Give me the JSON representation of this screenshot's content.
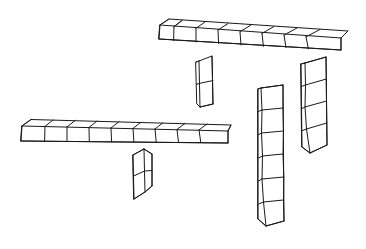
{
  "page": {
    "width": 366,
    "height": 249,
    "background_color": "#ffffff",
    "line_color": "#1a1a1a",
    "face_color": "#ffffff",
    "style": "hand-drawn isometric wireframe line art",
    "stroke_width": 1
  },
  "chart_data": {
    "type": "diagram",
    "subtitle": "",
    "grid": false,
    "legend": false,
    "axis_labels": {
      "x": "",
      "y": ""
    },
    "units_total": 31,
    "shape_count": 6,
    "shapes": [
      {
        "id": "top-horizontal-bar",
        "name": "Top horizontal bar",
        "orientation": "horizontal",
        "cube_count": 8,
        "bounding_box": {
          "x": 157,
          "y": 19,
          "width": 190,
          "height": 34
        },
        "notes": "Longest run; top face and front face both visible, receding to the right"
      },
      {
        "id": "upper-middle-stub",
        "name": "Upper middle vertical stub",
        "orientation": "vertical",
        "cube_count": 2,
        "bounding_box": {
          "x": 195,
          "y": 56,
          "width": 19,
          "height": 51
        },
        "notes": "Short two-cube post hanging below the top bar"
      },
      {
        "id": "left-horizontal-bar",
        "name": "Left horizontal bar",
        "orientation": "horizontal",
        "cube_count": 9,
        "bounding_box": {
          "x": 19,
          "y": 117,
          "width": 212,
          "height": 27
        },
        "notes": "Lower-left run; thin top face visible along the whole length"
      },
      {
        "id": "lower-middle-stub",
        "name": "Lower middle vertical stub",
        "orientation": "vertical",
        "cube_count": 2,
        "bounding_box": {
          "x": 130,
          "y": 149,
          "width": 22,
          "height": 51
        },
        "notes": "Two-cube post below the left bar with a visible top face"
      },
      {
        "id": "tall-right-column",
        "name": "Tall right column",
        "orientation": "vertical",
        "cube_count": 6,
        "bounding_box": {
          "x": 256,
          "y": 83,
          "width": 28,
          "height": 143
        },
        "notes": "Tallest column; slightly leaning, side face visible on the left"
      },
      {
        "id": "far-right-column",
        "name": "Far right column",
        "orientation": "vertical",
        "cube_count": 4,
        "bounding_box": {
          "x": 299,
          "y": 57,
          "width": 28,
          "height": 96
        },
        "notes": "Four-cube column at the far right, leaning left at the base"
      }
    ]
  },
  "a11y": {
    "image_role": "figure",
    "alt_text": "Six hand-drawn isometric wireframe chains of cubes of lengths eight, two, nine, two, six and four arranged on a white background."
  }
}
